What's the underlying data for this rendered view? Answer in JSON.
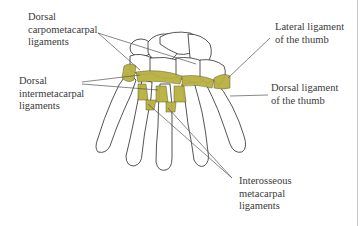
{
  "diagram": {
    "colors": {
      "bone_outline": "#2a2a2a",
      "ligament_fill": "#b8b040",
      "ligament_dark": "#5a5520",
      "leader_line": "#555555",
      "label_text": "#3a3a3a",
      "background": "#ffffff"
    },
    "labels": [
      {
        "id": "dorsal-carpometacarpal",
        "text": "Dorsal\ncarpometacarpal\nligaments"
      },
      {
        "id": "dorsal-intermetacarpal",
        "text": "Dorsal\nintermetacarpal\nligaments"
      },
      {
        "id": "lateral-ligament-thumb",
        "text": "Lateral ligament\nof the thumb"
      },
      {
        "id": "dorsal-ligament-thumb",
        "text": "Dorsal ligament\nof the thumb"
      },
      {
        "id": "interosseous-metacarpal",
        "text": "Interosseous\nmetacarpal\nligaments"
      }
    ]
  }
}
